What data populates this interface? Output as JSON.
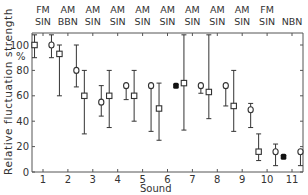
{
  "chart_data": {
    "type": "scatter",
    "title": "",
    "xlabel": "Sound",
    "ylabel": "Relative fluctuation strength",
    "ylabel_unit": "%",
    "ylim": [
      0,
      110
    ],
    "yticks": [
      0,
      20,
      40,
      60,
      80,
      100
    ],
    "categories": [
      "1",
      "2",
      "3",
      "4",
      "5",
      "6",
      "7",
      "8",
      "9",
      "10",
      "11"
    ],
    "top_labels": [
      {
        "sound": "1",
        "line1": "FM",
        "line2": "SIN"
      },
      {
        "sound": "2",
        "line1": "AM",
        "line2": "BBN"
      },
      {
        "sound": "3",
        "line1": "AM",
        "line2": "SIN"
      },
      {
        "sound": "4",
        "line1": "AM",
        "line2": "SIN"
      },
      {
        "sound": "5",
        "line1": "AM",
        "line2": "SIN"
      },
      {
        "sound": "6",
        "line1": "AM",
        "line2": "SIN"
      },
      {
        "sound": "7",
        "line1": "AM",
        "line2": "SIN"
      },
      {
        "sound": "8",
        "line1": "AM",
        "line2": "SIN"
      },
      {
        "sound": "9",
        "line1": "AM",
        "line2": "SIN"
      },
      {
        "sound": "10",
        "line1": "FM",
        "line2": "SIN"
      },
      {
        "sound": "11",
        "line1": "",
        "line2": "NBN"
      }
    ],
    "grid": false,
    "legend": "none",
    "series": [
      {
        "name": "squares",
        "marker": "open-square",
        "offset": -0.2,
        "values": [
          100,
          93,
          60,
          60,
          60,
          50,
          70,
          63,
          52,
          16,
          null
        ],
        "low": [
          90,
          60,
          30,
          35,
          40,
          25,
          33,
          42,
          32,
          9,
          null
        ],
        "high": [
          110,
          100,
          80,
          80,
          80,
          70,
          110,
          110,
          80,
          30,
          null
        ]
      },
      {
        "name": "circles",
        "marker": "open-circle",
        "offset": 0.2,
        "values": [
          100,
          80,
          55,
          68,
          68,
          null,
          68,
          68,
          49,
          16,
          16
        ],
        "low": [
          90,
          67,
          44,
          57,
          32,
          null,
          62,
          52,
          35,
          5,
          5
        ],
        "high": [
          110,
          100,
          68,
          68,
          68,
          null,
          68,
          68,
          54,
          22,
          16
        ]
      },
      {
        "name": "filled",
        "marker": "filled",
        "offset": 0.2,
        "values": [
          null,
          null,
          null,
          null,
          null,
          68,
          null,
          null,
          null,
          null,
          null
        ],
        "low": [
          null,
          null,
          null,
          null,
          null,
          null,
          null,
          null,
          null,
          null,
          null
        ],
        "high": [
          null,
          null,
          null,
          null,
          null,
          null,
          null,
          null,
          null,
          null,
          null
        ]
      },
      {
        "name": "filled-left",
        "marker": "filled",
        "offset": -0.2,
        "values": [
          null,
          null,
          null,
          null,
          null,
          null,
          null,
          null,
          null,
          null,
          12
        ],
        "low": [
          null,
          null,
          null,
          null,
          null,
          null,
          null,
          null,
          null,
          null,
          null
        ],
        "high": [
          null,
          null,
          null,
          null,
          null,
          null,
          null,
          null,
          null,
          null,
          null
        ]
      }
    ]
  },
  "colors": {
    "axis": "#555555",
    "ink": "#333333",
    "background": "#ffffff"
  }
}
